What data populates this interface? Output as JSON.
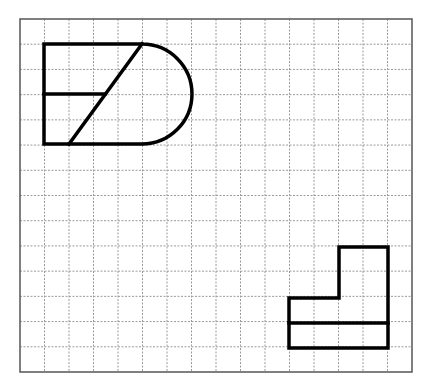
{
  "diagram": {
    "type": "grid-shapes",
    "grid": {
      "left": 20,
      "top": 19,
      "right": 412,
      "bottom": 372,
      "columns": 16,
      "rows": 14,
      "line_color": "#9a9a9a",
      "border_color": "#555555"
    },
    "stroke_color": "#000000",
    "shapes": [
      {
        "name": "rounded-rectangle-shape",
        "rect": {
          "x1": 44,
          "y1": 44,
          "x2": 142,
          "y2": 144
        },
        "semicircle_cap": {
          "cx": 142,
          "cy": 94,
          "r": 50,
          "side": "right"
        },
        "internal_lines": [
          {
            "name": "diagonal",
            "x1": 69,
            "y1": 144,
            "x2": 142,
            "y2": 44
          },
          {
            "name": "middle-horizontal",
            "x1": 44,
            "y1": 94,
            "x2": 105,
            "y2": 94
          }
        ]
      },
      {
        "name": "l-shape",
        "outline": [
          [
            289,
            298
          ],
          [
            339,
            298
          ],
          [
            339,
            247
          ],
          [
            388,
            247
          ],
          [
            388,
            348
          ],
          [
            289,
            348
          ]
        ],
        "internal_lines": [
          {
            "name": "middle-horizontal",
            "x1": 289,
            "y1": 323,
            "x2": 388,
            "y2": 323
          }
        ]
      }
    ]
  }
}
